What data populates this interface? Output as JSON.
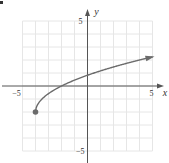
{
  "chart_data": {
    "type": "line",
    "title": "",
    "xlabel": "x",
    "ylabel": "y",
    "xlim": [
      -5,
      5
    ],
    "ylim": [
      -5,
      5
    ],
    "grid": true,
    "grid_step": 1,
    "x_tick_labels": [
      {
        "value": -5,
        "label": "−5"
      },
      {
        "value": 5,
        "label": "5"
      }
    ],
    "y_tick_labels": [
      {
        "value": 5,
        "label": "5"
      },
      {
        "value": -5,
        "label": "−5"
      }
    ],
    "series": [
      {
        "name": "curve",
        "function": "y = sqrt(2(x+4)) - 2",
        "start_point": {
          "x": -4,
          "y": -2,
          "marker": "closed-dot"
        },
        "end": "arrow",
        "points": [
          {
            "x": -4,
            "y": -2
          },
          {
            "x": -3.5,
            "y": -1
          },
          {
            "x": -3,
            "y": -0.59
          },
          {
            "x": -2,
            "y": 0
          },
          {
            "x": -1,
            "y": 0.45
          },
          {
            "x": 0,
            "y": 0.83
          },
          {
            "x": 1,
            "y": 1.16
          },
          {
            "x": 2,
            "y": 1.46
          },
          {
            "x": 3,
            "y": 1.74
          },
          {
            "x": 4,
            "y": 2
          },
          {
            "x": 5,
            "y": 2.24
          }
        ]
      }
    ],
    "colors": {
      "curve": "#6b6b6b",
      "axes": "#555555",
      "grid": "#e6e6e6"
    }
  }
}
